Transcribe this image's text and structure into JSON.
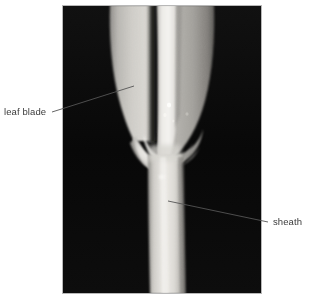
{
  "figure": {
    "kind": "labeled-photograph",
    "background_color": "#ffffff",
    "plate": {
      "name": "photograph",
      "background_color": "#0a0a0a",
      "left": 62,
      "top": 5,
      "width": 200,
      "height": 289
    }
  },
  "annotations": [
    {
      "id": "leaf-blade",
      "label": "leaf blade",
      "text_x": 4,
      "text_y": 106,
      "leader": {
        "x1": 52,
        "y1": 112,
        "x2": 134,
        "y2": 86
      },
      "color": "#3a3a3a"
    },
    {
      "id": "sheath",
      "label": "sheath",
      "text_x": 273,
      "text_y": 216,
      "leader": {
        "x1": 168,
        "y1": 201,
        "x2": 268,
        "y2": 222
      },
      "color": "#3a3a3a"
    }
  ],
  "labels": {
    "leaf_blade": "leaf blade",
    "sheath": "sheath"
  },
  "colors": {
    "page_background": "#ffffff",
    "photo_background": "#0a0a0a",
    "label_text": "#3a3a3a",
    "leader_line": "#555555",
    "blade_light": "#d8d6d2",
    "blade_mid": "#b4b2ae",
    "blade_shadow": "#6e6c69",
    "midrib_highlight": "#f2f1ee",
    "groove_dark": "#121212",
    "sheath_pale": "#e9e8e4",
    "collar_highlight": "#f6f5f2"
  }
}
